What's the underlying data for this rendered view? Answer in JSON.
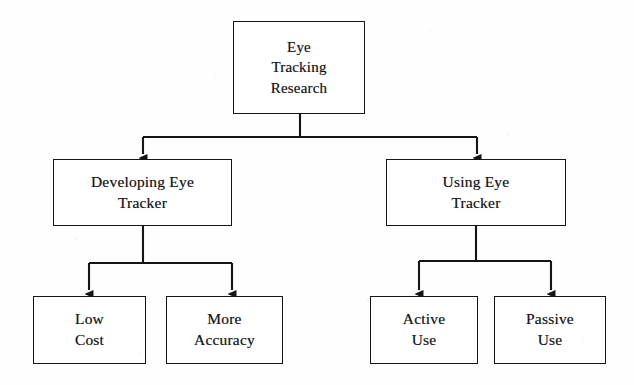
{
  "diagram": {
    "type": "hierarchy-tree",
    "background_color": "#fefefe",
    "line_color": "#151515",
    "text_color": "#17171a",
    "levels": 3,
    "nodes": [
      {
        "id": "root",
        "label": "Eye\nTracking\nResearch",
        "level": 1,
        "x": 233,
        "y": 21,
        "w": 132,
        "h": 93
      },
      {
        "id": "developing",
        "label": "Developing Eye\nTracker",
        "level": 2,
        "x": 53,
        "y": 159,
        "w": 179,
        "h": 67
      },
      {
        "id": "using",
        "label": "Using Eye\nTracker",
        "level": 2,
        "x": 386,
        "y": 159,
        "w": 180,
        "h": 67
      },
      {
        "id": "low-cost",
        "label": "Low\nCost",
        "level": 3,
        "x": 33,
        "y": 296,
        "w": 113,
        "h": 68
      },
      {
        "id": "more-accuracy",
        "label": "More\nAccuracy",
        "level": 3,
        "x": 166,
        "y": 296,
        "w": 117,
        "h": 68
      },
      {
        "id": "active-use",
        "label": "Active\nUse",
        "level": 3,
        "x": 370,
        "y": 296,
        "w": 108,
        "h": 68
      },
      {
        "id": "passive-use",
        "label": "Passive\nUse",
        "level": 3,
        "x": 494,
        "y": 296,
        "w": 112,
        "h": 68
      }
    ],
    "edges": [
      {
        "from": "root",
        "to": "developing",
        "arrow": true
      },
      {
        "from": "root",
        "to": "using",
        "arrow": true
      },
      {
        "from": "developing",
        "to": "low-cost",
        "arrow": true
      },
      {
        "from": "developing",
        "to": "more-accuracy",
        "arrow": true
      },
      {
        "from": "using",
        "to": "active-use",
        "arrow": true
      },
      {
        "from": "using",
        "to": "passive-use",
        "arrow": true
      }
    ]
  }
}
